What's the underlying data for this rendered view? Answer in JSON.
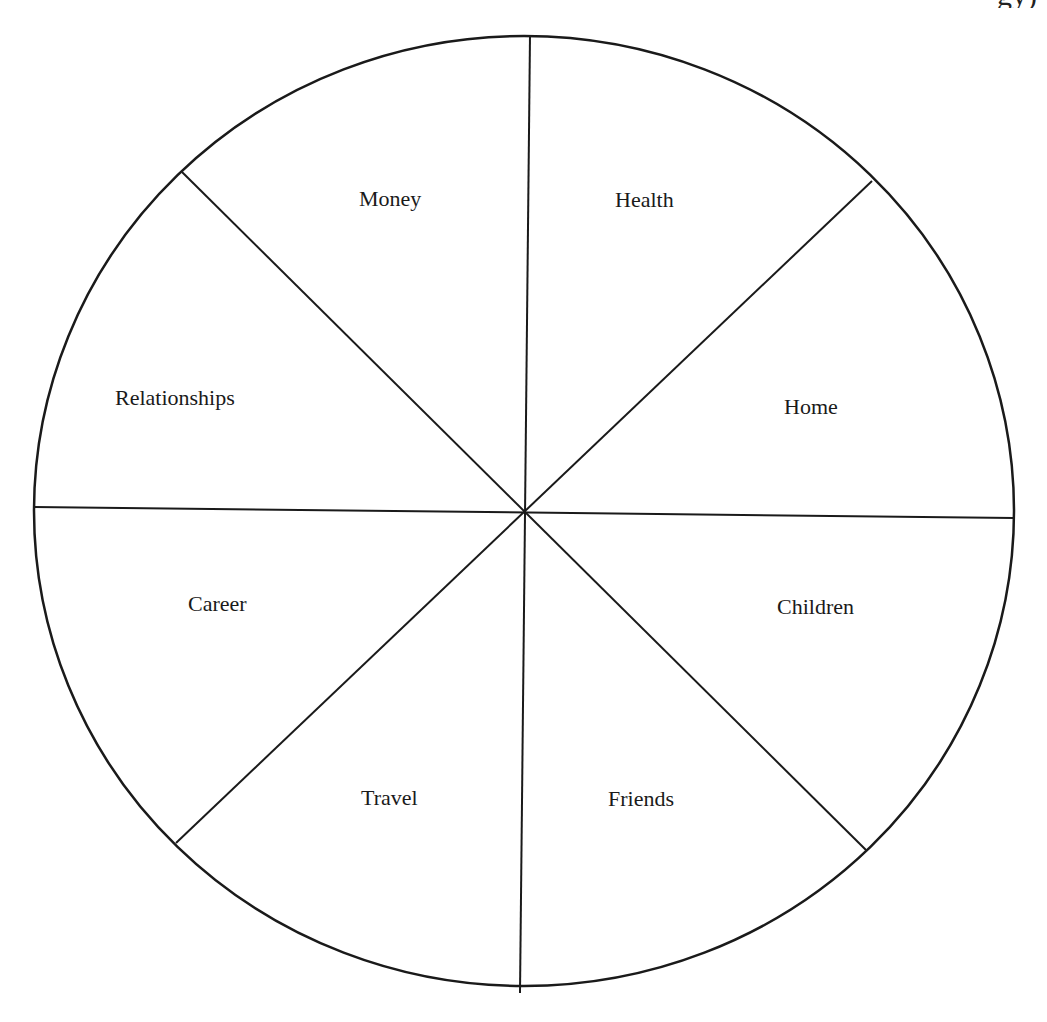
{
  "header": {
    "cut_off_text": "gy)"
  },
  "wheel": {
    "center": [
      524,
      512
    ],
    "rx": 490,
    "ry": 475,
    "stroke_color": "#1a1a1a",
    "segments": [
      {
        "label": "Money",
        "x": 359,
        "y": 206
      },
      {
        "label": "Health",
        "x": 615,
        "y": 207
      },
      {
        "label": "Relationships",
        "x": 115,
        "y": 405
      },
      {
        "label": "Home",
        "x": 784,
        "y": 414
      },
      {
        "label": "Career",
        "x": 188,
        "y": 611
      },
      {
        "label": "Children",
        "x": 777,
        "y": 614
      },
      {
        "label": "Travel",
        "x": 361,
        "y": 805
      },
      {
        "label": "Friends",
        "x": 608,
        "y": 806
      }
    ]
  }
}
